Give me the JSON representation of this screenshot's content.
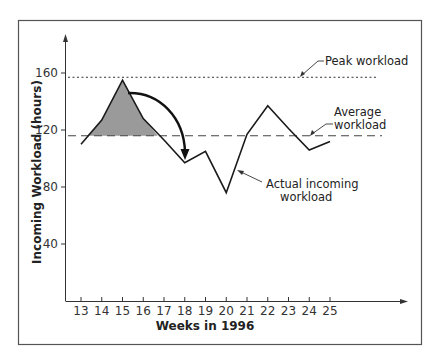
{
  "chart_data": {
    "type": "line",
    "title": "",
    "xlabel": "Weeks in 1996",
    "ylabel": "Incoming Workload (hours)",
    "x": [
      13,
      14,
      15,
      16,
      17,
      18,
      19,
      20,
      21,
      22,
      23,
      24,
      25
    ],
    "x_tick_labels": [
      "13",
      "14",
      "15",
      "16",
      "17",
      "18",
      "19",
      "20",
      "21",
      "22",
      "23",
      "24",
      "25"
    ],
    "y_tick_values": [
      40,
      80,
      120,
      160
    ],
    "y_tick_labels": [
      "40",
      "80",
      "120",
      "160"
    ],
    "ylim": [
      0,
      185
    ],
    "grid": false,
    "series": [
      {
        "name": "Actual incoming workload",
        "style": "solid",
        "values": [
          110,
          127,
          155,
          128,
          113,
          97,
          105,
          76,
          117,
          137,
          121,
          106,
          112
        ]
      },
      {
        "name": "Peak workload",
        "style": "dotted",
        "constant": 157
      },
      {
        "name": "Average workload",
        "style": "dashed",
        "constant": 116
      }
    ],
    "annotations": [
      {
        "text": "Peak workload",
        "target": "Peak workload line"
      },
      {
        "text": "Average workload",
        "lines": [
          "Average",
          "workload"
        ],
        "target": "Average workload line"
      },
      {
        "text": "Actual incoming workload",
        "lines": [
          "Actual incoming",
          "workload"
        ],
        "target": "Actual workload line"
      },
      {
        "text": "",
        "note": "Shaded area above average between weeks 13.3 and 16.7 with curved arrow shifting excess work to week 18"
      }
    ],
    "shaded_region": {
      "from_week": 13.3,
      "to_week": 16.7,
      "above": 116,
      "color": "#9a9a9a"
    }
  },
  "labels": {
    "ylabel": "Incoming Workload (hours)",
    "xlabel": "Weeks in 1996",
    "peak": "Peak workload",
    "average_1": "Average",
    "average_2": "workload",
    "actual_1": "Actual incoming",
    "actual_2": "workload"
  },
  "colors": {
    "line": "#1a1a1a",
    "shade": "#9a9a9a",
    "frame": "#555555"
  }
}
